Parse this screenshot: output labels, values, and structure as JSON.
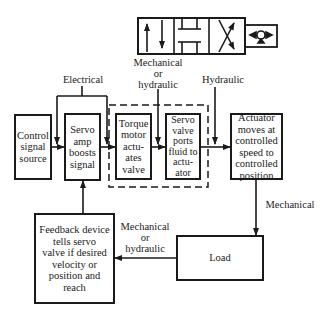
{
  "diagram": {
    "boxes": {
      "control": "Control\nsignal\nsource",
      "servo_amp": "Servo\namp\nboosts\nsignal",
      "torque_motor": "Torque\nmotor\nactu-\nates\nvalve",
      "servo_valve": "Servo\nvalve\nports\nfluid to\nactu-\nator",
      "actuator": "Actuator\nmoves at\ncontrolled\nspeed to\ncontrolled\nposition",
      "load": "Load",
      "feedback": "Feedback device\ntells servo\nvalve if desired\nvelocity or\nposition and\nreach"
    },
    "labels": {
      "electrical": "Electrical",
      "mech_or_hyd_top": "Mechanical\nor\nhydraulic",
      "hydraulic": "Hydraulic",
      "mechanical": "Mechanical",
      "mech_or_hyd_bottom": "Mechanical\nor\nhydraulic"
    },
    "symbol": "servo-valve-symbol"
  }
}
